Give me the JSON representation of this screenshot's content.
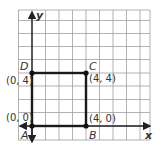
{
  "figure": {
    "type": "coordinate-grid-square",
    "axes": {
      "x_label": "x",
      "y_label": "y"
    },
    "grid": {
      "color": "#9a9a9a",
      "cells_x": 10,
      "cells_y": 10
    },
    "shape_color": "#1a1a1a",
    "points": [
      {
        "name": "A",
        "coord": "(0, 0)",
        "x": 0,
        "y": 0
      },
      {
        "name": "B",
        "coord": "(4, 0)",
        "x": 4,
        "y": 0
      },
      {
        "name": "C",
        "coord": "(4, 4)",
        "x": 4,
        "y": 4
      },
      {
        "name": "D",
        "coord": "(0, 4)",
        "x": 0,
        "y": 4
      }
    ]
  }
}
